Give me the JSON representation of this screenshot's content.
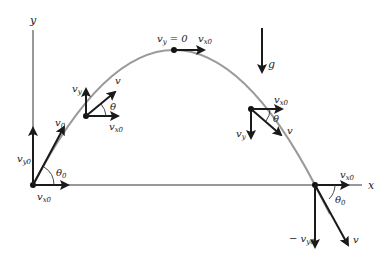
{
  "diagram": {
    "type": "projectile-motion",
    "colors": {
      "trajectory": "#9a9a9a",
      "vectors": "#1a1a1a",
      "axes": "#333333",
      "background": "#ffffff"
    },
    "axes": {
      "x_label": "x",
      "y_label": "y"
    },
    "gravity": {
      "label": "g"
    },
    "points": {
      "launch": {
        "v0": "v",
        "v0_sub": "0",
        "vy0": "v",
        "vy0_sub": "y0",
        "vx0": "v",
        "vx0_sub": "x0",
        "angle": "θ",
        "angle_sub": "0"
      },
      "ascending": {
        "v": "v",
        "vy": "v",
        "vy_sub": "y",
        "vx0": "v",
        "vx0_sub": "x0",
        "angle": "θ"
      },
      "peak": {
        "vy_zero": "v",
        "vy_zero_sub": "y",
        "vy_zero_eq": " = 0",
        "vx0": "v",
        "vx0_sub": "x0"
      },
      "descending": {
        "v": "v",
        "vy": "v",
        "vy_sub": "y",
        "vx0": "v",
        "vx0_sub": "x0",
        "angle": "θ"
      },
      "landing": {
        "v": "v",
        "neg_vy0": "− v",
        "neg_vy0_sub": "y0",
        "vx0": "v",
        "vx0_sub": "x0",
        "angle": "θ",
        "angle_sub": "0"
      }
    }
  }
}
